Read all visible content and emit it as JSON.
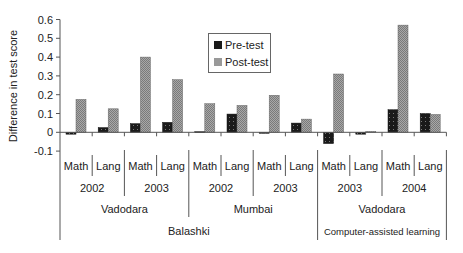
{
  "chart_data": {
    "type": "bar",
    "title": "",
    "xlabel": "",
    "ylabel": "Difference in test score",
    "ylim": [
      -0.1,
      0.6
    ],
    "yticks": [
      -0.1,
      0,
      0.1,
      0.2,
      0.3,
      0.4,
      0.5,
      0.6
    ],
    "ytick_labels": [
      "-0.1",
      "0",
      "0.1",
      "0.2",
      "0.3",
      "0.4",
      "0.5",
      "0.6"
    ],
    "grid": false,
    "legend_position": "upper center (inside plot)",
    "categories": [
      "Math",
      "Lang",
      "Math",
      "Lang",
      "Math",
      "Lang",
      "Math",
      "Lang",
      "Math",
      "Lang",
      "Math",
      "Lang"
    ],
    "category_groups": {
      "years": [
        {
          "label": "2002",
          "span": 2
        },
        {
          "label": "2003",
          "span": 2
        },
        {
          "label": "2002",
          "span": 2
        },
        {
          "label": "2003",
          "span": 2
        },
        {
          "label": "2003",
          "span": 2
        },
        {
          "label": "2004",
          "span": 2
        }
      ],
      "cities": [
        {
          "label": "Vadodara",
          "span": 4
        },
        {
          "label": "Mumbai",
          "span": 4
        },
        {
          "label": "Vadodara",
          "span": 4
        }
      ],
      "programs": [
        {
          "label": "Balashki",
          "span": 8
        },
        {
          "label": "Computer-assisted learning",
          "span": 4
        }
      ]
    },
    "series": [
      {
        "name": "Pre-test",
        "pattern": "dark-dotted",
        "values": [
          -0.01,
          0.025,
          0.046,
          0.053,
          0.003,
          0.097,
          -0.005,
          0.049,
          -0.06,
          -0.01,
          0.12,
          0.1
        ]
      },
      {
        "name": "Post-test",
        "pattern": "light-grey-hatched",
        "values": [
          0.175,
          0.125,
          0.4,
          0.28,
          0.152,
          0.143,
          0.197,
          0.07,
          0.31,
          0.005,
          0.57,
          0.095
        ]
      }
    ]
  },
  "legend": {
    "items": [
      {
        "label": "Pre-test"
      },
      {
        "label": "Post-test"
      }
    ]
  },
  "colors": {
    "pre": "#1a1a1a",
    "post": "#9a9a9a",
    "axis": "#555555"
  }
}
